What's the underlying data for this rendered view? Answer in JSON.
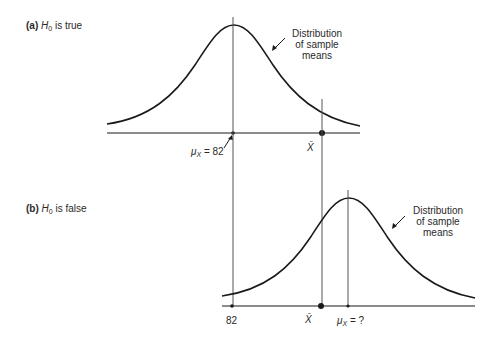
{
  "panels": [
    {
      "id": "a",
      "tag": "(a)",
      "hypothesis_symbol": "H",
      "hypothesis_sub": "0",
      "condition": "is true",
      "callout": [
        "Distribution",
        "of sample",
        "means"
      ],
      "mean_label_symbol": "μ",
      "mean_label_sub": "X",
      "mean_label_value": "= 82",
      "sample_mean_label": "X̄"
    },
    {
      "id": "b",
      "tag": "(b)",
      "hypothesis_symbol": "H",
      "hypothesis_sub": "0",
      "condition": "is false",
      "callout": [
        "Distribution",
        "of sample",
        "means"
      ],
      "reference_value": "82",
      "sample_mean_label": "X̄",
      "mean_label_symbol": "μ",
      "mean_label_sub": "X",
      "mean_label_value": "= ?"
    }
  ],
  "colors": {
    "line": "#1a1a1a",
    "guide": "#555555",
    "text": "#2a2a2a"
  }
}
